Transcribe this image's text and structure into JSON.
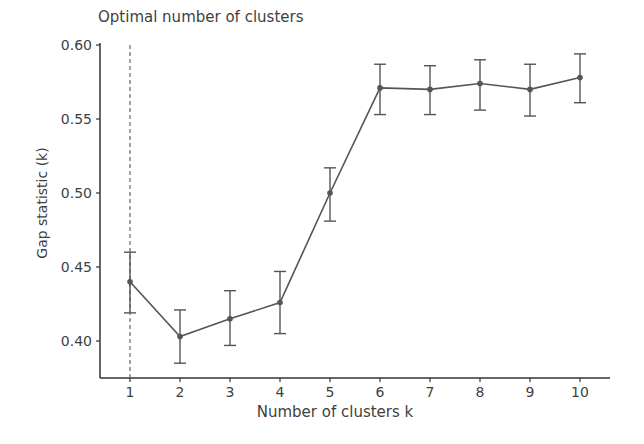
{
  "chart_data": {
    "type": "line",
    "title": "Optimal number of clusters",
    "xlabel": "Number of clusters k",
    "ylabel": "Gap statistic (k)",
    "x": [
      1,
      2,
      3,
      4,
      5,
      6,
      7,
      8,
      9,
      10
    ],
    "series": [
      {
        "name": "Gap statistic",
        "values": [
          0.44,
          0.403,
          0.415,
          0.426,
          0.5,
          0.571,
          0.57,
          0.574,
          0.57,
          0.578
        ],
        "error_low": [
          0.419,
          0.385,
          0.397,
          0.405,
          0.481,
          0.553,
          0.553,
          0.556,
          0.552,
          0.561
        ],
        "error_high": [
          0.46,
          0.421,
          0.434,
          0.447,
          0.517,
          0.587,
          0.586,
          0.59,
          0.587,
          0.594
        ],
        "color": "#555555"
      }
    ],
    "optimal_k_line": 1,
    "xticks": [
      "1",
      "2",
      "3",
      "4",
      "5",
      "6",
      "7",
      "8",
      "9",
      "10"
    ],
    "yticks": [
      "0.40",
      "0.45",
      "0.50",
      "0.55",
      "0.60"
    ],
    "ylim": [
      0.378,
      0.6
    ],
    "xlim": [
      0.4,
      10.6
    ],
    "grid": false,
    "legend": null
  }
}
